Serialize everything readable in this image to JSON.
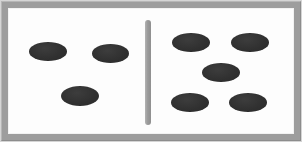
{
  "figure": {
    "name": "dot-comparison-tile",
    "width": 302,
    "height": 142,
    "background_color": "#ffffff",
    "frame": {
      "color": "#9d9d9d",
      "outer_rim_color": "#d5d5d5",
      "thickness": 8
    },
    "field": {
      "color": "#fdfdfd",
      "x": 8,
      "y": 8,
      "width": 286,
      "height": 126
    },
    "divider": {
      "name": "center-divider-bar",
      "color": "#a0a0a0",
      "x": 145,
      "y": 20,
      "width": 6,
      "height": 105,
      "orientation": "vertical",
      "rounded": true
    }
  },
  "dot_style": {
    "color": "#343434",
    "shape": "ellipse",
    "width": 38,
    "height": 19
  },
  "halves": [
    {
      "side": "left",
      "label": "left-half",
      "count": 3,
      "dots": [
        {
          "label": "left-dot-1",
          "x": 29,
          "y": 42,
          "w": 38,
          "h": 19
        },
        {
          "label": "left-dot-2",
          "x": 92,
          "y": 44,
          "w": 37,
          "h": 19
        },
        {
          "label": "left-dot-3",
          "x": 61,
          "y": 86,
          "w": 38,
          "h": 20
        }
      ]
    },
    {
      "side": "right",
      "label": "right-half",
      "count": 5,
      "dots": [
        {
          "label": "right-dot-1",
          "x": 172,
          "y": 33,
          "w": 38,
          "h": 19
        },
        {
          "label": "right-dot-2",
          "x": 231,
          "y": 33,
          "w": 38,
          "h": 19
        },
        {
          "label": "right-dot-3",
          "x": 202,
          "y": 63,
          "w": 38,
          "h": 19
        },
        {
          "label": "right-dot-4",
          "x": 171,
          "y": 93,
          "w": 38,
          "h": 19
        },
        {
          "label": "right-dot-5",
          "x": 229,
          "y": 93,
          "w": 38,
          "h": 19
        }
      ]
    }
  ]
}
